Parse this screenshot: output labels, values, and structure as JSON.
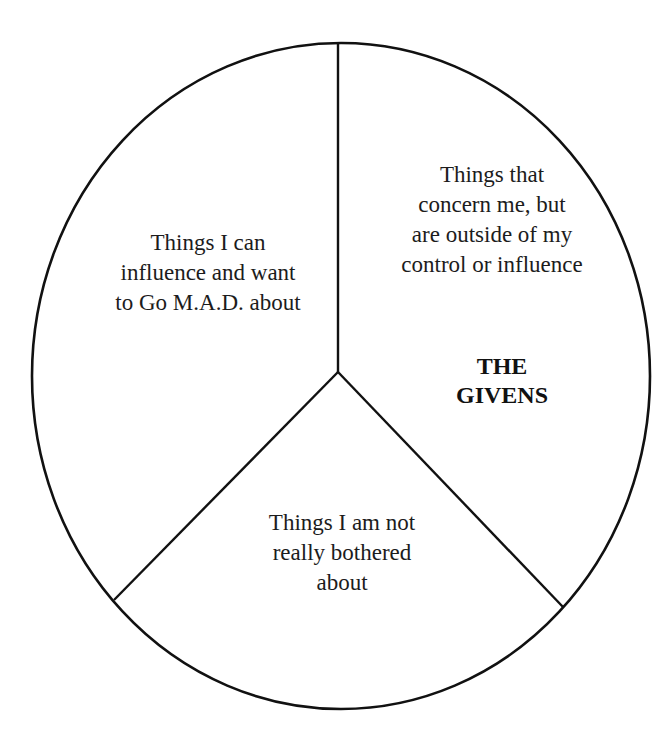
{
  "diagram": {
    "type": "pie-style circle divided into three segments",
    "stroke_color": "#111111",
    "background_color": "#ffffff",
    "segments": [
      {
        "id": "left",
        "lines": [
          "Things I can",
          "influence and want",
          "to Go M.A.D. about"
        ]
      },
      {
        "id": "right",
        "lines": [
          "Things that",
          "concern me, but",
          "are outside of my",
          "control or influence"
        ],
        "emphasis_lines": [
          "THE",
          "GIVENS"
        ]
      },
      {
        "id": "bottom",
        "lines": [
          "Things I am not",
          "really bothered",
          "about"
        ]
      }
    ]
  }
}
